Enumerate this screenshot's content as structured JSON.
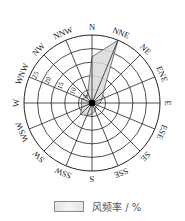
{
  "chart_data": {
    "type": "wind-rose",
    "title": "",
    "directions": [
      "N",
      "NNE",
      "NE",
      "ENE",
      "E",
      "ESE",
      "SE",
      "SSE",
      "S",
      "SSW",
      "SW",
      "WSW",
      "W",
      "WNW",
      "NW",
      "NNW"
    ],
    "values": [
      17,
      25,
      6,
      4,
      3,
      2,
      2,
      3,
      4,
      5,
      6,
      4,
      4,
      4,
      3,
      4
    ],
    "unit": "%",
    "rings": [
      5,
      10,
      15,
      20,
      25
    ],
    "ring_labels": [
      "5",
      "10",
      "15",
      "20",
      "25"
    ],
    "ring_label_direction": "WNW",
    "rmax": 25,
    "legend": [
      {
        "label": "风频率 / %",
        "fill": "#e2e2e2"
      }
    ],
    "grid": true
  },
  "legend": {
    "label": "风频率 / %"
  },
  "colors": {
    "petal_fill": "#d9d9d9",
    "petal_stroke": "#555555",
    "grid": "#222222"
  }
}
